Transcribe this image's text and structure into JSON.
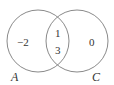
{
  "diagram": {
    "type": "venn",
    "sets": [
      {
        "name": "A",
        "only_elements": [
          "-2"
        ]
      },
      {
        "name": "C",
        "only_elements": [
          "0"
        ]
      }
    ],
    "intersection": [
      "1",
      "3"
    ],
    "labels": {
      "set_a": "A",
      "set_c": "C",
      "a_only": "−2",
      "intersection_top": "1",
      "intersection_bottom": "3",
      "c_only": "0"
    },
    "colors": {
      "stroke": "#8a8a8a",
      "text": "#333333"
    }
  }
}
